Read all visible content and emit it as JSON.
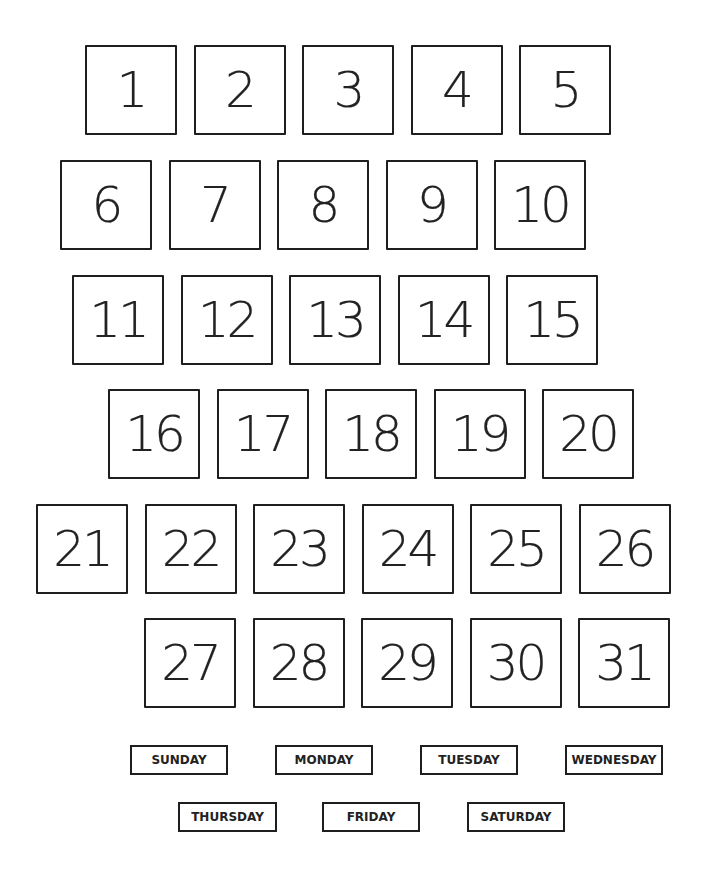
{
  "numbers": {
    "rows": [
      {
        "x": 85,
        "y": 45,
        "labels": [
          "1",
          "2",
          "3",
          "4",
          "5"
        ]
      },
      {
        "x": 60,
        "y": 160,
        "labels": [
          "6",
          "7",
          "8",
          "9",
          "10"
        ]
      },
      {
        "x": 72,
        "y": 275,
        "labels": [
          "11",
          "12",
          "13",
          "14",
          "15"
        ]
      },
      {
        "x": 108,
        "y": 389,
        "labels": [
          "16",
          "17",
          "18",
          "19",
          "20"
        ]
      },
      {
        "x": 36,
        "y": 504,
        "labels": [
          "21",
          "22",
          "23",
          "24",
          "25",
          "26"
        ]
      },
      {
        "x": 144,
        "y": 618,
        "labels": [
          "27",
          "28",
          "29",
          "30",
          "31"
        ]
      }
    ]
  },
  "days": [
    {
      "label": "SUNDAY",
      "x": 130,
      "y": 745,
      "w": 98
    },
    {
      "label": "MONDAY",
      "x": 275,
      "y": 745,
      "w": 98
    },
    {
      "label": "TUESDAY",
      "x": 420,
      "y": 745,
      "w": 98
    },
    {
      "label": "WEDNESDAY",
      "x": 565,
      "y": 745,
      "w": 98
    },
    {
      "label": "THURSDAY",
      "x": 178,
      "y": 802,
      "w": 99
    },
    {
      "label": "FRIDAY",
      "x": 322,
      "y": 802,
      "w": 98
    },
    {
      "label": "SATURDAY",
      "x": 467,
      "y": 802,
      "w": 98
    }
  ]
}
